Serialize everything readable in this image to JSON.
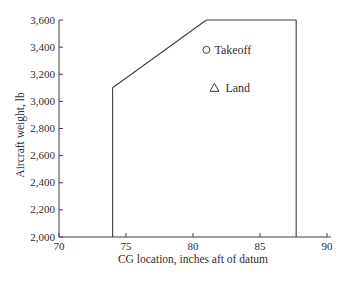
{
  "figure": {
    "background": "#ffffff"
  },
  "chart_data": {
    "type": "line",
    "title": "",
    "xlabel": "CG location, inches aft of datum",
    "ylabel": "Aircraft weight, lb",
    "xlim": [
      70,
      90
    ],
    "ylim": [
      2000,
      3600
    ],
    "grid": false,
    "legend_position": "none",
    "axis_color": "#3f3f3f",
    "text_color": "#2f2f2f",
    "xticks": [
      {
        "v": 70,
        "label": "70"
      },
      {
        "v": 75,
        "label": "75"
      },
      {
        "v": 80,
        "label": "80"
      },
      {
        "v": 85,
        "label": "85"
      },
      {
        "v": 90,
        "label": "90"
      }
    ],
    "yticks": [
      {
        "v": 2000,
        "label": "2,000"
      },
      {
        "v": 2200,
        "label": "2,200"
      },
      {
        "v": 2400,
        "label": "2,400"
      },
      {
        "v": 2600,
        "label": "2,600"
      },
      {
        "v": 2800,
        "label": "2,800"
      },
      {
        "v": 3000,
        "label": "3,000"
      },
      {
        "v": 3200,
        "label": "3,200"
      },
      {
        "v": 3400,
        "label": "3,400"
      },
      {
        "v": 3600,
        "label": "3,600"
      }
    ],
    "series": [
      {
        "name": "cg-envelope",
        "type": "line",
        "color": "#3f3f3f",
        "points": [
          [
            74,
            2000
          ],
          [
            74,
            3100
          ],
          [
            81,
            3600
          ],
          [
            87.7,
            3600
          ],
          [
            87.7,
            2000
          ]
        ]
      },
      {
        "name": "takeoff-point",
        "type": "scatter",
        "marker": "circle",
        "label": "Takeoff",
        "x": 81,
        "y": 3380
      },
      {
        "name": "land-point",
        "type": "scatter",
        "marker": "triangle",
        "label": "Land",
        "x": 81.6,
        "y": 3100
      }
    ]
  }
}
